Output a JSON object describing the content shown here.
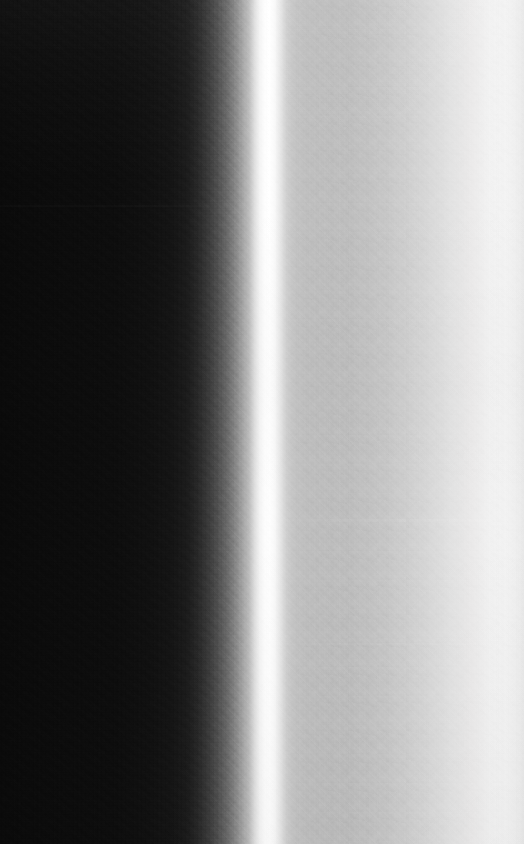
{
  "image": {
    "title": "Grayscale vertical luminance gradient with specular band",
    "kind": "natural-image",
    "width": 524,
    "height": 844,
    "color_mode": "grayscale",
    "description": "A monochrome photographic frame. The left third is near-black with visible shadow grain, a steep luminance ramp rises to a narrow blown-out white vertical stripe about halfway across, then the tone drops to a mid-gray plateau and brightens gradually to near-white at the right edge."
  },
  "regions": [
    {
      "name": "dark-field",
      "label": "Dark field",
      "x_start_pct": 0,
      "x_end_pct": 32,
      "luminance_hex": "#0a0a0a",
      "note": "Near-black with pronounced sensor grain and blocky compression noise"
    },
    {
      "name": "shadow-ramp",
      "label": "Shadow ramp",
      "x_start_pct": 32,
      "x_end_pct": 47,
      "luminance_hex": "#4a4a4a",
      "note": "Steep rising gradient from near-black to light gray"
    },
    {
      "name": "specular-band",
      "label": "Specular band",
      "x_start_pct": 47,
      "x_end_pct": 54,
      "luminance_hex": "#ffffff",
      "note": "Narrow blown-out highlight, peak at roughly x = 270 px"
    },
    {
      "name": "gray-plateau",
      "label": "Gray plateau",
      "x_start_pct": 54,
      "x_end_pct": 66,
      "luminance_hex": "#bcbcbc",
      "note": "Flat mid-gray shoulder just right of the highlight"
    },
    {
      "name": "bright-field",
      "label": "Bright field",
      "x_start_pct": 66,
      "x_end_pct": 100,
      "luminance_hex": "#f6f6f6",
      "note": "Slow brightening toward a near-white right edge"
    }
  ],
  "features": {
    "band_peak_x_px": 270,
    "band_peak_hex": "#ffffff",
    "left_edge_hex": "#0a0a0a",
    "right_edge_hex": "#f5f5f5",
    "plateau_hex": "#bcbcbc",
    "seams": [
      {
        "name": "seam-upper",
        "y_px": 205,
        "note": "Faint horizontal sensor seam, left half"
      },
      {
        "name": "seam-mid",
        "y_px": 519,
        "note": "Faint horizontal sensor seam, right half"
      },
      {
        "name": "seam-lower",
        "y_px": 643,
        "note": "Faint horizontal sensor seam, right half"
      }
    ],
    "grain": {
      "dark_side": "strong",
      "light_side": "subtle mottle"
    }
  }
}
